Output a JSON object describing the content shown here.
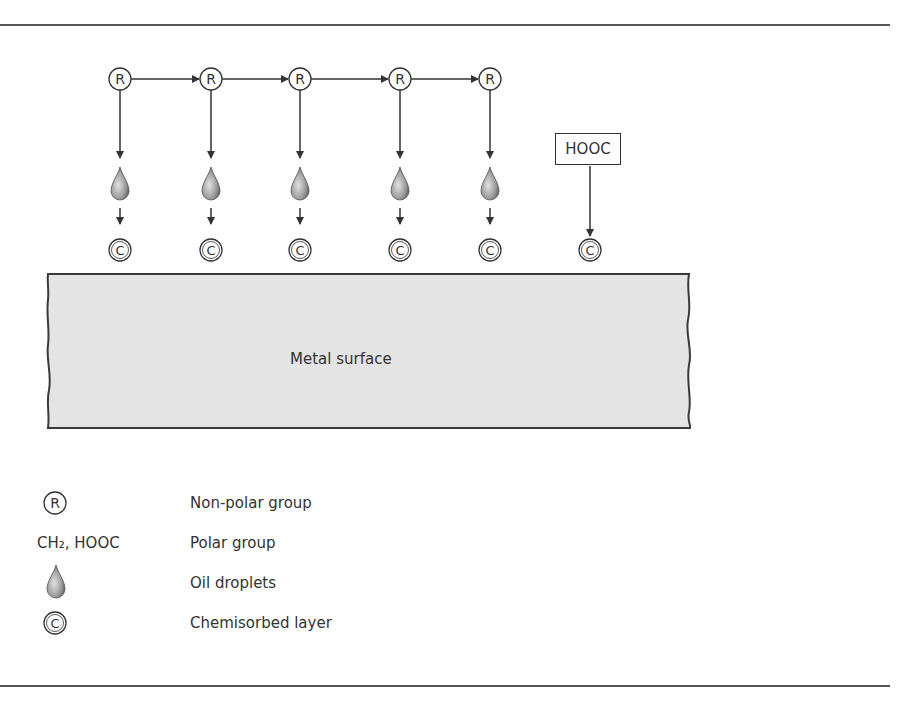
{
  "diagram": {
    "metal_surface_label": "Metal surface",
    "node_r_label": "R",
    "node_c_label": "C",
    "hooc_label": "HOOC",
    "columns_x": [
      120,
      211,
      300,
      400,
      490
    ],
    "hooc_column_x": 590,
    "colors": {
      "line": "#333333",
      "metal_fill": "#e4e4e4",
      "droplet_dark": "#5a5a5a",
      "droplet_light": "#d8d8d8"
    }
  },
  "legend": {
    "items": [
      {
        "symbol": "R",
        "symbol_type": "circle",
        "label": "Non-polar group"
      },
      {
        "symbol": "CH₂, HOOC",
        "symbol_type": "text",
        "label": "Polar group"
      },
      {
        "symbol": "droplet",
        "symbol_type": "droplet-icon",
        "label": "Oil droplets"
      },
      {
        "symbol": "C",
        "symbol_type": "circle",
        "label": "Chemisorbed layer"
      }
    ]
  }
}
